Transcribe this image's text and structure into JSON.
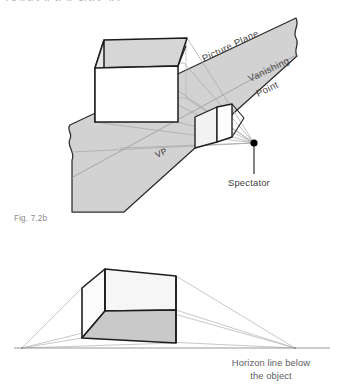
{
  "figure": {
    "caption": "Fig. 7.2b",
    "top_bleed_text": "pgqpjpyqp jpqp gpjpy qpp"
  },
  "colors": {
    "plane_fill": "#d2d2d2",
    "plane_stroke": "#2b2b2b",
    "box_top_fill": "#d6d6d6",
    "box_side_fill": "#ffffff",
    "box_bottom_fill": "#c9c9c9",
    "ray_line": "#a9a9a9",
    "outline": "#1d1d1d",
    "text_gray": "#58585a",
    "caption_gray": "#8b8b8d",
    "horizon_line": "#9a9a9a",
    "spectator_dot": "#000000"
  },
  "upper_diagram": {
    "name": "one-point-perspective-setup",
    "labels": {
      "picture_plane": "Picture Plane",
      "vanishing_point_line1": "Vanishing",
      "vanishing_point_line2": "Point",
      "vp_abbrev": "VP",
      "spectator": "Spectator"
    },
    "elements": {
      "picture_plane": "torn-edged gray band running lower-left to upper-right",
      "object_box": "large axonometric box at left",
      "projected_image": "small box drawn on the picture plane",
      "sight_lines": "light gray rays from object corners converging at spectator",
      "spectator_dot": "black dot with vertical leader line"
    }
  },
  "lower_diagram": {
    "name": "two-point-perspective-below-horizon",
    "labels": {
      "horizon_note_line1": "Horizon line below",
      "horizon_note_line2": "the object"
    },
    "elements": {
      "object_box": "rectangular box seen from below",
      "horizon_line": "horizontal line across full width",
      "left_vanishing_point": "left end of horizon line",
      "right_vanishing_point": "right end of horizon line",
      "convergence_lines": "light gray lines from box edges to both vanishing points"
    }
  }
}
